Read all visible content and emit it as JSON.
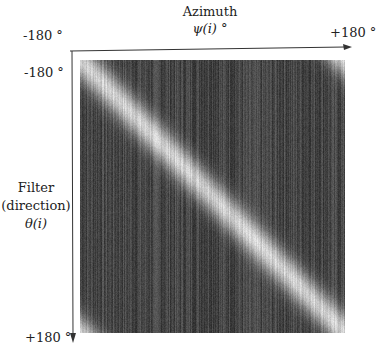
{
  "figure": {
    "x_axis": {
      "title": "Azimuth",
      "symbol": "ψ(i) °",
      "min_label": "-180 °",
      "max_label": "+180 °"
    },
    "y_axis": {
      "title_line1": "Filter",
      "title_line2": "(direction)",
      "symbol": "θ(i)",
      "min_label": "-180 °",
      "max_label": "+180 °"
    }
  },
  "chart_data": {
    "type": "heatmap",
    "title": "",
    "xlabel": "Azimuth ψ(i) °",
    "ylabel": "Filter (direction) θ(i)",
    "x_range": [
      -180,
      180
    ],
    "y_range": [
      -180,
      180
    ],
    "colormap": "gray",
    "band_width_deg": 40
  }
}
